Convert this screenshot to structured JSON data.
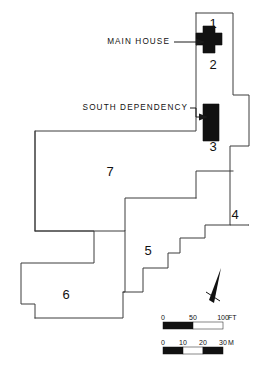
{
  "figure": {
    "kind": "site-plan",
    "width": 260,
    "height": 368,
    "background_color": "#ffffff",
    "line_color": "#3d3d3d",
    "building_fill": "#111111"
  },
  "callouts": [
    {
      "id": "main-house",
      "label": "MAIN HOUSE",
      "text_x": 170,
      "text_y": 42,
      "leader": "M174,42 L196,42",
      "arrow": "196,38.5 205,42 196,45.5"
    },
    {
      "id": "south-dependency",
      "label": "SOUTH DEPENDENCY",
      "text_x": 188,
      "text_y": 108,
      "leader": "M190,108 L196,108 L196,117 L199,117",
      "arrow": "199,113.5 208,117 199,120.5"
    }
  ],
  "zone_labels": [
    {
      "id": "zone-1",
      "text": "1",
      "x": 213,
      "y": 25
    },
    {
      "id": "zone-2",
      "text": "2",
      "x": 213,
      "y": 66
    },
    {
      "id": "zone-3",
      "text": "3",
      "x": 213,
      "y": 148
    },
    {
      "id": "zone-4",
      "text": "4",
      "x": 235,
      "y": 216
    },
    {
      "id": "zone-5",
      "text": "5",
      "x": 148,
      "y": 252
    },
    {
      "id": "zone-6",
      "text": "6",
      "x": 66,
      "y": 296
    },
    {
      "id": "zone-7",
      "text": "7",
      "x": 110,
      "y": 173
    }
  ],
  "buildings": [
    {
      "id": "main-house",
      "shape": "cross",
      "description": "cross-shaped main dwelling, solid black",
      "path": "M203,26 L215,26 L215,33 L222,33 L222,45 L215,45 L215,53 L203,53 L203,45 L196,45 L196,33 L203,33 Z"
    },
    {
      "id": "south-dependency",
      "shape": "rectangle",
      "description": "rectangular outbuilding, solid black",
      "path": "M203,104 L219,104 L219,141 L203,141 Z"
    }
  ],
  "parcel_outlines": [
    {
      "id": "parcel-north-strip",
      "path": "M196,13 L233,13 L233,95 L249,95 L249,146 L230,146 L230,225 L249,225 L249,225"
    },
    {
      "id": "parcel-block-1",
      "path": "M196,13 L196,131 L35,131 L35,231 L125,231 L125,198 L196,198"
    },
    {
      "id": "parcel-4-edge",
      "path": "M196,198 L196,171 L233,171"
    },
    {
      "id": "parcel-mid",
      "path": "M230,225 L205,225 L205,238 L180,238 L180,253 L168,253 L168,268 L143,268 L143,292 L123,292"
    },
    {
      "id": "parcel-5-left",
      "path": "M125,231 L125,292 L123,292 L123,318 L35,318"
    },
    {
      "id": "parcel-6",
      "path": "M35,231 L94,231 L94,263 L21,263 L21,304 L35,304 L35,318"
    },
    {
      "id": "parcel-7-lower",
      "path": "M35,131 L35,231"
    }
  ],
  "north_arrow": {
    "id": "north-arrow",
    "body": "221,268 214,303 209,300",
    "crossbar": "M206,292 L220,301"
  },
  "scales": [
    {
      "id": "scale-feet",
      "unit": "FT",
      "ticks": [
        "0",
        "50",
        "100"
      ],
      "tick_positions": [
        163,
        193,
        223
      ],
      "unit_label_x": 228,
      "label_y": 320,
      "bar_y": 322,
      "bar_height": 7,
      "segments": [
        {
          "x": 163,
          "w": 30,
          "fill": "dark"
        },
        {
          "x": 193,
          "w": 30,
          "fill": "light"
        }
      ]
    },
    {
      "id": "scale-meters",
      "unit": "M",
      "ticks": [
        "0",
        "10",
        "20",
        "30"
      ],
      "tick_positions": [
        163,
        183,
        203,
        223
      ],
      "unit_label_x": 228,
      "label_y": 345,
      "bar_y": 347,
      "bar_height": 7,
      "segments": [
        {
          "x": 163,
          "w": 20,
          "fill": "dark"
        },
        {
          "x": 183,
          "w": 20,
          "fill": "light"
        },
        {
          "x": 203,
          "w": 20,
          "fill": "dark"
        },
        {
          "x": 223,
          "w": 0,
          "fill": "light"
        }
      ]
    }
  ]
}
